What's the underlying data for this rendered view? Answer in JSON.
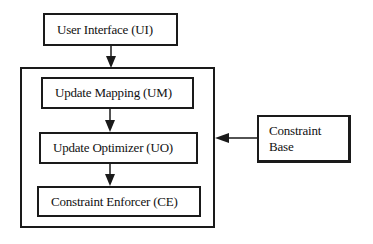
{
  "diagram": {
    "type": "block-diagram",
    "nodes": {
      "ui": {
        "label": "User Interface (UI)"
      },
      "um": {
        "label": "Update Mapping (UM)"
      },
      "uo": {
        "label": "Update Optimizer (UO)"
      },
      "ce": {
        "label": "Constraint Enforcer (CE)"
      },
      "cb": {
        "label_line1": "Constraint",
        "label_line2": "Base"
      }
    },
    "groups": [
      {
        "id": "outer",
        "contains": [
          "um",
          "uo",
          "ce"
        ]
      }
    ],
    "edges": [
      {
        "from": "ui",
        "to": "outer"
      },
      {
        "from": "um",
        "to": "uo"
      },
      {
        "from": "uo",
        "to": "ce"
      },
      {
        "from": "cb",
        "to": "outer"
      }
    ],
    "colors": {
      "stroke": "#1a1a1a",
      "background": "#ffffff"
    }
  }
}
